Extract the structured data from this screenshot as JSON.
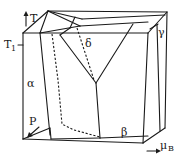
{
  "figure": {
    "type": "3d-phase-diagram",
    "axes": {
      "vertical": "T",
      "depth": "P",
      "horizontal": "μ",
      "horizontal_subscript": "B"
    },
    "tick_label": "T",
    "tick_subscript": "1",
    "phases": [
      "α",
      "β",
      "γ",
      "δ"
    ],
    "colors": {
      "line": "#1a1a1a",
      "background": "#ffffff"
    }
  },
  "geometry": {
    "solid_lines": [
      [
        23,
        33,
        148,
        33
      ],
      [
        148,
        33,
        165,
        12
      ],
      [
        48,
        11,
        165,
        12
      ],
      [
        23,
        33,
        48,
        11
      ],
      [
        23,
        33,
        23,
        139
      ],
      [
        23,
        139,
        143,
        143
      ],
      [
        143,
        143,
        148,
        33
      ],
      [
        165,
        12,
        163,
        128
      ],
      [
        163,
        128,
        143,
        143
      ],
      [
        157,
        33,
        163,
        128
      ],
      [
        48,
        11,
        78,
        27
      ],
      [
        78,
        27,
        165,
        14
      ],
      [
        48,
        11,
        40,
        33
      ],
      [
        40,
        33,
        49,
        128
      ],
      [
        49,
        128,
        23,
        139
      ],
      [
        78,
        27,
        101,
        20
      ],
      [
        101,
        20,
        117,
        20
      ],
      [
        101,
        20,
        93,
        83
      ],
      [
        63,
        32,
        93,
        83
      ],
      [
        93,
        83,
        99,
        138
      ],
      [
        99,
        138,
        143,
        128
      ],
      [
        99,
        138,
        52,
        150
      ],
      [
        52,
        150,
        49,
        128
      ]
    ],
    "dashed_lines": [
      [
        52,
        36,
        60,
        80
      ],
      [
        60,
        80,
        62,
        125
      ],
      [
        62,
        125,
        73,
        130
      ],
      [
        73,
        130,
        99,
        138
      ],
      [
        83,
        23,
        93,
        83
      ]
    ]
  }
}
